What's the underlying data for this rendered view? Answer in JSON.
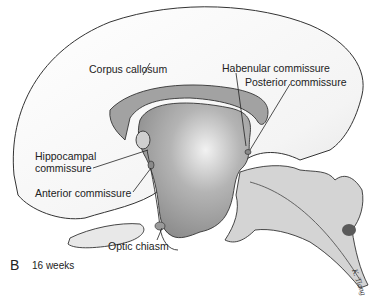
{
  "figure": {
    "panel_letter": "B",
    "caption": "16 weeks",
    "signature": "K. Tiang",
    "colors": {
      "background": "#ffffff",
      "outline": "#333333",
      "hemisphere_fill": "#f6f6f6",
      "ventricle_fill": "#b8b8b8",
      "ventricle_dark": "#8a8a8a",
      "brainstem_fill": "#d2d2d2",
      "corpus_callosum_fill": "#a0a0a0",
      "nucleus_spot": "#5a5a5a"
    },
    "labels": {
      "corpus_callosum": "Corpus callosum",
      "habenular_commissure": "Habenular commissure",
      "posterior_commissure": "Posterior commissure",
      "hippocampal_commissure_line1": "Hippocampal",
      "hippocampal_commissure_line2": "commissure",
      "anterior_commissure": "Anterior commissure",
      "optic_chiasm": "Optic chiasm"
    }
  }
}
